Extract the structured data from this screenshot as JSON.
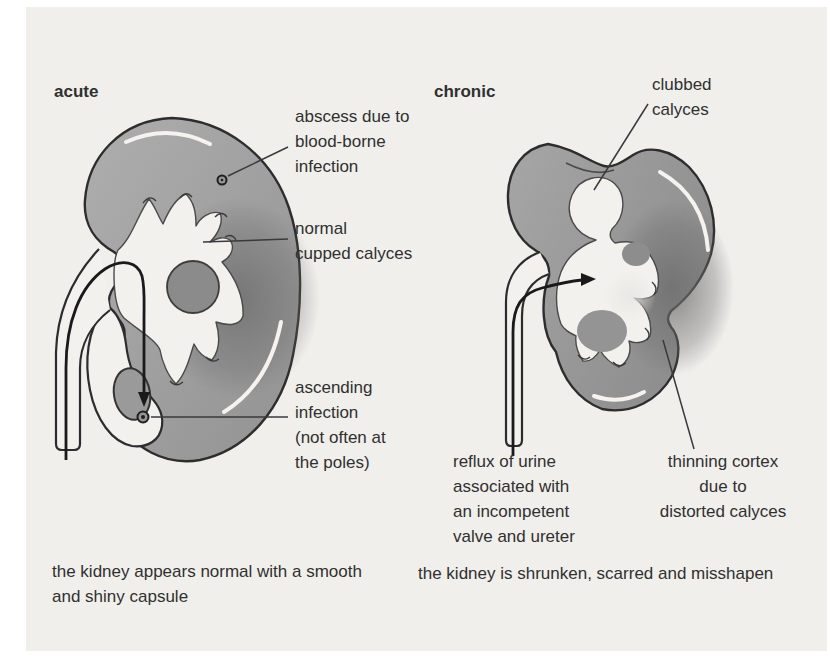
{
  "panels": {
    "acute": {
      "label": "acute",
      "annotations": {
        "abscess": "abscess due to\nblood-borne\ninfection",
        "cupped": "normal\ncupped calyces",
        "ascending": "ascending\ninfection\n(not often at\nthe poles)"
      },
      "caption": "the kidney appears normal with a smooth\nand shiny capsule"
    },
    "chronic": {
      "label": "chronic",
      "annotations": {
        "clubbed": "clubbed\ncalyces",
        "reflux": "reflux of urine\nassociated with\nan incompetent\nvalve and ureter",
        "thinning": "thinning cortex\ndue to\ndistorted calyces"
      },
      "caption": "the kidney is shrunken, scarred and misshapen"
    }
  },
  "colors": {
    "page_background": "#f1efec",
    "cortex_light": "#a9a9a9",
    "cortex_dark": "#8f8f8f",
    "medulla": "#6d6d6d",
    "interior_white": "#f3f1ee",
    "outline": "#2d2d2d",
    "text": "#303030"
  }
}
